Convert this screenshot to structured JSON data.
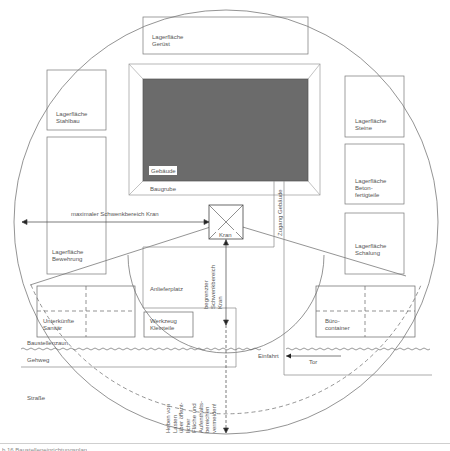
{
  "figure": {
    "caption": "b 16 Baustelleneinrichtungsplan"
  },
  "labels": {
    "lager_geruest": [
      "Lagerfläche",
      "Gerüst"
    ],
    "lager_stahlbau": [
      "Lagerfläche",
      "Stahlbau"
    ],
    "lager_bewehrung": [
      "Lagerfläche",
      "Bewehrung"
    ],
    "lager_steine": [
      "Lagerfläche",
      "Steine"
    ],
    "lager_beton": [
      "Lagerfläche",
      "Beton-",
      "fertigteile"
    ],
    "lager_schalung": [
      "Lagerfläche",
      "Schalung"
    ],
    "gebaeude": "Gebäude",
    "baugrube": "Baugrube",
    "zugang": "Zugang Gebäude",
    "schwenkbereich": "maximaler Schwenkbereich Kran",
    "kran": "Kran",
    "begrenzter": [
      "begrenzter",
      "Schwenkbereich",
      "Kran"
    ],
    "anlieferplatz": "Anlieferplatz",
    "unterkuenfte": [
      "Unterkünfte",
      "Sanitär"
    ],
    "werkzeug": [
      "Werkzeug",
      "Kleinteile"
    ],
    "buero": [
      "Büro-",
      "container"
    ],
    "bauzaun": "Baustellenzaun",
    "gehweg": "Gehweg",
    "einfahrt": "Einfahrt",
    "tor": "Tor",
    "strasse": "Straße",
    "heben": [
      "Heben von",
      "Lasten",
      "über öffent-",
      "licher",
      "Fläche und",
      "Aufenthalts-",
      "bereichen",
      "vermeiden!"
    ]
  },
  "colors": {
    "line": "#555555",
    "building_fill": "#6b6b6b",
    "text": "#555555"
  }
}
